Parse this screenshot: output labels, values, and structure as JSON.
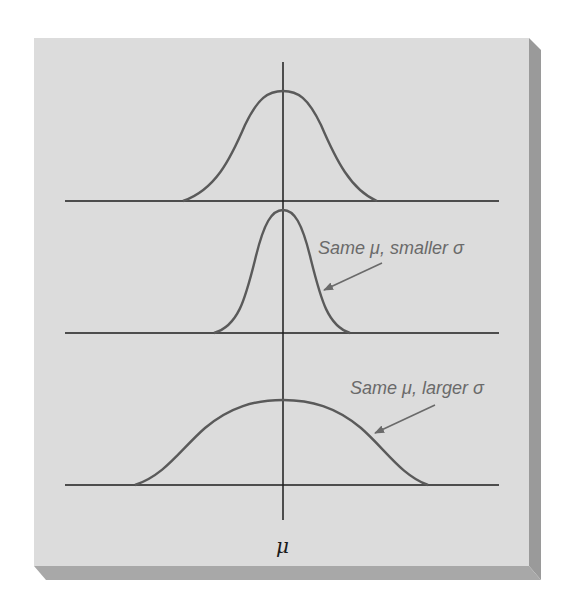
{
  "figure": {
    "panel_color": "#dcdcdc",
    "bevel_side_color": "#9a9a9a",
    "bevel_bottom_color": "#a8a8a8",
    "curve_color": "#5a5a5a",
    "axis_color": "#1e1e1e",
    "annotation_color": "#6a6a6a"
  },
  "axis": {
    "center_label": "μ"
  },
  "curves": [
    {
      "name": "reference",
      "annotation": ""
    },
    {
      "name": "smaller-sigma",
      "annotation": "Same μ, smaller σ"
    },
    {
      "name": "larger-sigma",
      "annotation": "Same μ, larger σ"
    }
  ],
  "annotations": {
    "smaller": "Same μ, smaller σ",
    "larger": "Same μ, larger σ"
  }
}
